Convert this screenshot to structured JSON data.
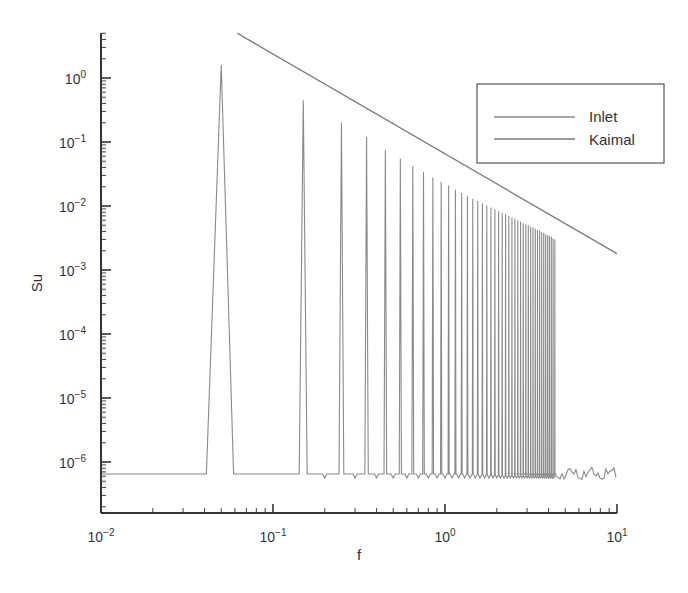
{
  "chart_data": {
    "type": "line",
    "title": "",
    "xlabel": "f",
    "ylabel": "Su",
    "xscale": "log",
    "yscale": "log",
    "xlim": [
      0.01,
      10
    ],
    "ylim": [
      1.6e-07,
      8
    ],
    "x_ticks": [
      {
        "value": 0.01,
        "base": "10",
        "exp": "−2"
      },
      {
        "value": 0.1,
        "base": "10",
        "exp": "−1"
      },
      {
        "value": 1,
        "base": "10",
        "exp": "0"
      },
      {
        "value": 10,
        "base": "10",
        "exp": "1"
      }
    ],
    "y_ticks": [
      {
        "value": 1,
        "base": "10",
        "exp": "0"
      },
      {
        "value": 0.1,
        "base": "10",
        "exp": "−1"
      },
      {
        "value": 0.01,
        "base": "10",
        "exp": "−2"
      },
      {
        "value": 0.001,
        "base": "10",
        "exp": "−3"
      },
      {
        "value": 0.0001,
        "base": "10",
        "exp": "−4"
      },
      {
        "value": 1e-05,
        "base": "10",
        "exp": "−5"
      },
      {
        "value": 1e-06,
        "base": "10",
        "exp": "−6"
      }
    ],
    "grid": false,
    "legend_position": "upper right",
    "series": [
      {
        "name": "Inlet",
        "color": "#8a8a8a",
        "baseline": 6.5e-07,
        "baseline_noise_after_f": 4.3,
        "peaks_f": [
          0.05,
          0.15,
          0.25,
          0.35,
          0.45,
          0.55,
          0.65,
          0.75,
          0.85,
          0.95,
          1.05,
          1.15,
          1.25,
          1.35,
          1.45,
          1.55,
          1.65,
          1.75,
          1.85,
          1.95,
          2.05,
          2.15,
          2.25,
          2.35,
          2.45,
          2.55,
          2.65,
          2.75,
          2.85,
          2.95,
          3.05,
          3.15,
          3.25,
          3.35,
          3.45,
          3.55,
          3.65,
          3.75,
          3.85,
          3.95,
          4.05,
          4.15,
          4.25,
          4.35
        ],
        "peaks_su": [
          1.6,
          0.45,
          0.2,
          0.12,
          0.075,
          0.055,
          0.042,
          0.034,
          0.028,
          0.024,
          0.021,
          0.018,
          0.016,
          0.0145,
          0.013,
          0.012,
          0.011,
          0.0102,
          0.0095,
          0.0089,
          0.0083,
          0.0078,
          0.0074,
          0.007,
          0.0066,
          0.0063,
          0.006,
          0.0057,
          0.0054,
          0.0052,
          0.005,
          0.0048,
          0.0046,
          0.0044,
          0.0042,
          0.0041,
          0.0039,
          0.0038,
          0.0036,
          0.0035,
          0.0034,
          0.0033,
          0.0031,
          0.003
        ]
      },
      {
        "name": "Kaimal",
        "color": "#7a7a7a",
        "x": [
          0.062,
          10
        ],
        "values": [
          5.0,
          0.0018
        ]
      }
    ]
  },
  "legend": {
    "items": [
      {
        "label": "Inlet"
      },
      {
        "label": "Kaimal"
      }
    ]
  },
  "axes": {
    "xlabel": "f",
    "ylabel": "Su"
  }
}
